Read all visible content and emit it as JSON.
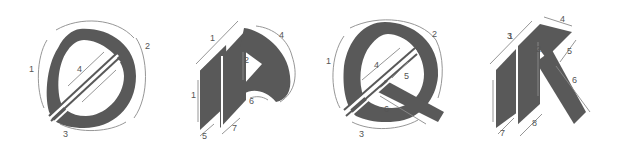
{
  "diagram": {
    "colors": {
      "ink": "#595959",
      "guide": "#8a8a8a",
      "label": "#555555",
      "background": "#ffffff"
    },
    "letters": [
      {
        "letter": "O",
        "strokes": [
          "1",
          "2",
          "3",
          "4"
        ]
      },
      {
        "letter": "P",
        "strokes": [
          "1",
          "1",
          "2",
          "4",
          "5",
          "6",
          "7"
        ]
      },
      {
        "letter": "Q",
        "strokes": [
          "1",
          "2",
          "3",
          "4",
          "5",
          "6"
        ]
      },
      {
        "letter": "K",
        "strokes": [
          "1",
          "2",
          "3",
          "4",
          "5",
          "6",
          "7",
          "8"
        ]
      }
    ]
  }
}
